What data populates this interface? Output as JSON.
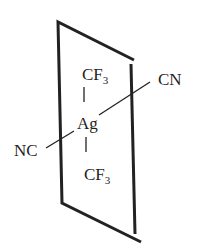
{
  "diagram": {
    "type": "coordination-geometry",
    "center_atom": "Ag",
    "ligands": {
      "top": {
        "main": "CF",
        "sub": "3"
      },
      "bottom": {
        "main": "CF",
        "sub": "3"
      },
      "right": "CN",
      "left": "NC"
    },
    "plane": {
      "shape": "parallelogram",
      "stroke": "#222222"
    },
    "colors": {
      "line": "#222222",
      "text": "#1f1f1f",
      "background": "#ffffff"
    }
  }
}
